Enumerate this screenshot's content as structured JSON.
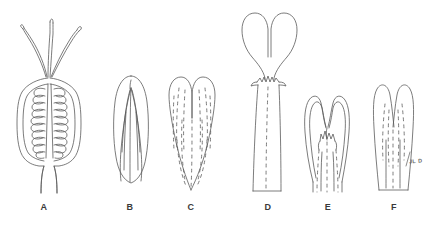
{
  "plate": {
    "width": 442,
    "height": 235,
    "background_color": "#ffffff",
    "ink_color": "#5a5a5a",
    "label_color": "#3a3a3a",
    "description": "Botanical line drawing plate of six structures labelled A through F"
  },
  "figures": [
    {
      "key": "a",
      "label": "A",
      "label_x": 44,
      "label_y": 202,
      "name": "ovary-with-coiled-placentae-and-styles",
      "notes": "Longitudinal section of an ovate ovary showing a central axis flanked by coiled placental rows, three slender styles emerging from the apex, and a tapering stalk at the base"
    },
    {
      "key": "b",
      "label": "B",
      "label_x": 130,
      "label_y": 202,
      "name": "entire-elliptic-blade",
      "notes": "Entire elliptic blade with a rounded apex and converging longitudinal veins"
    },
    {
      "key": "c",
      "label": "C",
      "label_x": 191,
      "label_y": 202,
      "name": "bilobed-cordate-blade",
      "notes": "Deeply notched cordate blade with two rounded lobes and dashed internal venation"
    },
    {
      "key": "d",
      "label": "D",
      "label_x": 268,
      "label_y": 202,
      "name": "bilobed-blade-with-ligule-and-long-sheath",
      "notes": "Bilobed blade narrowing to a neck above a toothed ligule crown, continuing into a long straight sheath"
    },
    {
      "key": "e",
      "label": "E",
      "label_x": 328,
      "label_y": 202,
      "name": "bilobed-blade-with-inner-ligule",
      "notes": "Short bilobed blade with a doubled outline and a small toothed ligule set within the sinus"
    },
    {
      "key": "f",
      "label": "F",
      "label_x": 394,
      "label_y": 202,
      "name": "bilobed-blade-with-truncate-base",
      "notes": "Bilobed blade with faint dashed venation and a truncate base"
    }
  ],
  "signature": {
    "text": "JL D",
    "x": 409,
    "y": 158,
    "name": "artist-signature"
  }
}
